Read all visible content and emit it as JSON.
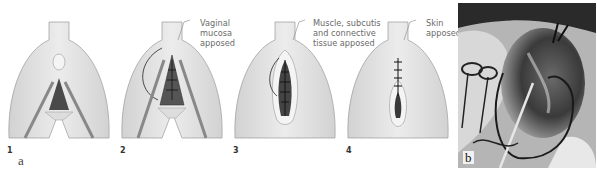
{
  "figure": {
    "part_a": {
      "letter": "a",
      "steps": [
        {
          "number": "1",
          "callout": ""
        },
        {
          "number": "2",
          "callout": "Vaginal\nmucosa\napposed"
        },
        {
          "number": "3",
          "callout": "Muscle, subcutis\nand connective\ntissue apposed"
        },
        {
          "number": "4",
          "callout": "Skin\napposed"
        }
      ]
    },
    "part_b": {
      "letter": "b",
      "description": "grayscale intraoperative photograph with surgical instruments"
    }
  },
  "colors": {
    "skin_fill": "#e4e4e4",
    "skin_stroke": "#9a9a9a",
    "wound_dark": "#3c3c3c",
    "suture": "#222222",
    "label_text": "#6a6a6a"
  }
}
